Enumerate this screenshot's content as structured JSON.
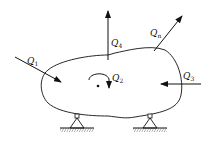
{
  "diagram": {
    "forces": [
      {
        "id": "Q1",
        "label": "Q",
        "sub": "1"
      },
      {
        "id": "Q2",
        "label": "Q",
        "sub": "2"
      },
      {
        "id": "Q3",
        "label": "Q",
        "sub": "3"
      },
      {
        "id": "Q4",
        "label": "Q",
        "sub": "4"
      },
      {
        "id": "Qn",
        "label": "Q",
        "sub": "n"
      }
    ],
    "supports": [
      "left-pin-support",
      "right-pin-support"
    ],
    "colors": {
      "stroke": "#111111",
      "background": "#ffffff"
    }
  }
}
